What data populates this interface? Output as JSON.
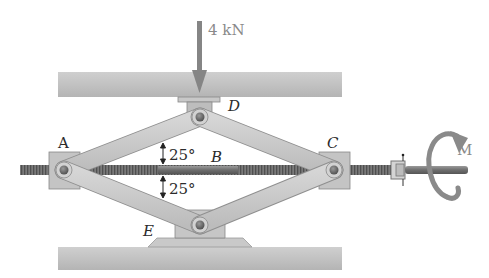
{
  "diagram": {
    "type": "mechanism",
    "load": {
      "label": "4 kN",
      "direction": "down",
      "applied_at": "D"
    },
    "moment": {
      "label": "M",
      "applied_to": "screw handle"
    },
    "points": {
      "A": "A",
      "B": "B",
      "C": "C",
      "D": "D",
      "E": "E"
    },
    "angles": [
      {
        "label": "25°",
        "position": "above screw, between AD link and screw"
      },
      {
        "label": "25°",
        "position": "below screw, between AE link and screw"
      }
    ],
    "colors": {
      "link": "#c9c9c9",
      "link_edge": "#8f8f8f",
      "beam": "#bdbdbd",
      "pin": "#6a6a6a",
      "arrow": "#7f7f7f",
      "screw": "#6b6b6b"
    }
  }
}
